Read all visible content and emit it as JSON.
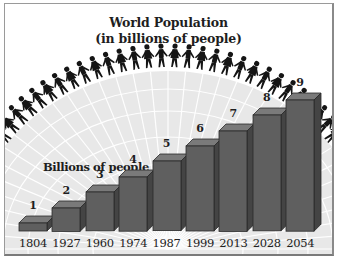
{
  "title_line1": "World Population",
  "title_line2": "(in billions of people)",
  "chart_data": {
    "type": "bar",
    "title": "World Population (in billions of people)",
    "ylabel": "Billions of people",
    "xlabel": "",
    "categories": [
      "1804",
      "1927",
      "1960",
      "1974",
      "1987",
      "1999",
      "2013",
      "2028",
      "2054"
    ],
    "values": [
      1,
      2,
      3,
      4,
      5,
      6,
      7,
      8,
      9
    ],
    "data_labels": [
      "1",
      "2",
      "3",
      "4",
      "5",
      "6",
      "7",
      "8",
      "9"
    ],
    "ylim": [
      0,
      9
    ],
    "grid": false,
    "legend": null,
    "style": "3D bars over globe with ring of people holding hands"
  },
  "colors": {
    "bar_front": "#5f5f5f",
    "bar_top": "#7a7a7a",
    "bar_side": "#444444",
    "globe": "#e6e6e6",
    "silhouettes": "#151515",
    "text": "#1e1e1e"
  }
}
